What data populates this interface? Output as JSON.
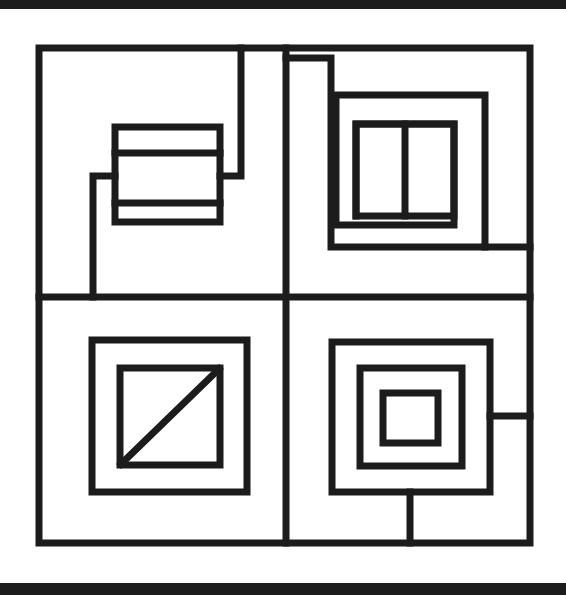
{
  "image": {
    "title": "Abstract Nested Rectangles Line Drawing",
    "width": 566,
    "height": 595,
    "background_color": "#ffffff",
    "ink_color": "#1c1c1c",
    "description": "Black and white scanned line drawing: a large square frame divided into four quadrants, each containing nested rectangular maze-like figures."
  },
  "scan_artifacts": {
    "top_band": {
      "label": "top-scan-edge",
      "y": 0,
      "height": 9,
      "color": "#1c1c1c"
    },
    "bottom_band": {
      "label": "bottom-scan-edge",
      "y": 583,
      "height": 12,
      "color": "#1c1c1c"
    }
  },
  "chart_data": {
    "type": "line-drawing",
    "xlabel": "",
    "ylabel": "",
    "grid": false,
    "legend": "none",
    "xlim": [
      0,
      566
    ],
    "ylim": [
      0,
      595
    ],
    "stroke_color": "#1c1c1c",
    "stroke_width_main": 7,
    "stroke_width_inner": 6,
    "shapes": [
      {
        "name": "outer-frame",
        "kind": "rect",
        "x": 39,
        "y": 48,
        "w": 491,
        "h": 495,
        "stroke_width": 7
      },
      {
        "name": "vertical-divider",
        "kind": "line",
        "x1": 286,
        "y1": 48,
        "x2": 286,
        "y2": 543,
        "stroke_width": 7
      },
      {
        "name": "horizontal-divider",
        "kind": "line",
        "x1": 39,
        "y1": 297,
        "x2": 530,
        "y2": 297,
        "stroke_width": 7
      },
      {
        "name": "tl-banded-rect",
        "kind": "rect",
        "x": 115,
        "y": 127,
        "w": 105,
        "h": 95,
        "stroke_width": 7
      },
      {
        "name": "tl-band-line-upper",
        "kind": "line",
        "x1": 115,
        "y1": 153,
        "x2": 220,
        "y2": 153,
        "stroke_width": 7
      },
      {
        "name": "tl-band-line-lower",
        "kind": "line",
        "x1": 115,
        "y1": 203,
        "x2": 220,
        "y2": 203,
        "stroke_width": 7
      },
      {
        "name": "tl-upper-step-hook",
        "kind": "polyline",
        "points": "241,48 241,176 220,176",
        "stroke_width": 7
      },
      {
        "name": "tl-lower-step-hook",
        "kind": "polyline",
        "points": "115,176 93,176 93,297",
        "stroke_width": 7
      },
      {
        "name": "tr-spiral-outer",
        "kind": "polyline",
        "points": "286,58 331,58 331,247 485,247 485,95 336,95 336,225 454,225 454,124 356,124 356,216",
        "stroke_width": 7
      },
      {
        "name": "tr-inner-rect",
        "kind": "rect",
        "x": 356,
        "y": 124,
        "w": 98,
        "h": 92,
        "stroke_width": 7
      },
      {
        "name": "tr-inner-divider",
        "kind": "line",
        "x1": 405,
        "y1": 124,
        "x2": 405,
        "y2": 216,
        "stroke_width": 7
      },
      {
        "name": "tr-right-shelf",
        "kind": "line",
        "x1": 485,
        "y1": 247,
        "x2": 530,
        "y2": 247,
        "stroke_width": 7
      },
      {
        "name": "bl-outer-square",
        "kind": "rect",
        "x": 92,
        "y": 340,
        "w": 155,
        "h": 152,
        "stroke_width": 7
      },
      {
        "name": "bl-inner-square",
        "kind": "rect",
        "x": 120,
        "y": 368,
        "w": 100,
        "h": 97,
        "stroke_width": 7
      },
      {
        "name": "bl-diagonal",
        "kind": "line",
        "x1": 121,
        "y1": 464,
        "x2": 219,
        "y2": 369,
        "stroke_width": 7
      },
      {
        "name": "br-square-outer",
        "kind": "rect",
        "x": 332,
        "y": 342,
        "w": 158,
        "h": 150,
        "stroke_width": 7
      },
      {
        "name": "br-square-middle",
        "kind": "rect",
        "x": 360,
        "y": 368,
        "w": 102,
        "h": 98,
        "stroke_width": 7
      },
      {
        "name": "br-square-inner",
        "kind": "rect",
        "x": 383,
        "y": 393,
        "w": 55,
        "h": 50,
        "stroke_width": 7
      },
      {
        "name": "br-right-shelf",
        "kind": "line",
        "x1": 490,
        "y1": 416,
        "x2": 530,
        "y2": 416,
        "stroke_width": 7
      },
      {
        "name": "br-bottom-stem",
        "kind": "line",
        "x1": 410,
        "y1": 492,
        "x2": 410,
        "y2": 543,
        "stroke_width": 7
      }
    ]
  }
}
